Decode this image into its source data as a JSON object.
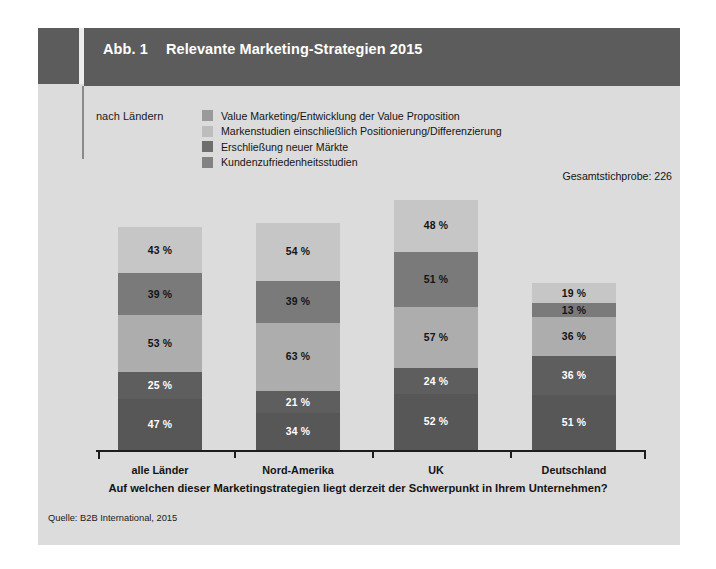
{
  "figure": {
    "number_label": "Abb. 1",
    "title": "Relevante Marketing-Strategien 2015",
    "subtitle": "nach Ländern",
    "sample_size": "Gesamtstichprobe: 226",
    "question": "Auf welchen dieser Marketingstrategien liegt derzeit der Schwerpunkt in Ihrem Unternehmen?",
    "source": "Quelle: B2B International, 2015"
  },
  "colors": {
    "page_background": "#ffffff",
    "panel_background": "#dcdcdc",
    "header_bar": "#5c5c5c",
    "header_text": "#ffffff",
    "axis": "#1d1d1d",
    "series": [
      "#c6c6c6",
      "#7a7a7a",
      "#adadad",
      "#5e5e5e",
      "#575757"
    ]
  },
  "legend": {
    "items": [
      {
        "label": "Value Marketing/Entwicklung der Value Proposition",
        "color": "#9a9a9a"
      },
      {
        "label": "Markenstudien einschließlich Positionierung/Differenzierung",
        "color": "#bdbdbd"
      },
      {
        "label": "Erschließung neuer Märkte",
        "color": "#6e6e6e"
      },
      {
        "label": "Kundenzufriedenheitsstudien",
        "color": "#828282"
      }
    ]
  },
  "chart_data": {
    "type": "bar",
    "subtype": "stacked-vertical",
    "title": "Relevante Marketing-Strategien 2015",
    "xlabel": "",
    "ylabel": "",
    "grid": false,
    "legend_position": "top",
    "value_suffix": " %",
    "categories": [
      "alle Länder",
      "Nord-Amerika",
      "UK",
      "Deutschland"
    ],
    "stack_order": "top-to-bottom",
    "series": [
      {
        "name": "Segment 1 (oben)",
        "color": "#c6c6c6",
        "values": [
          43,
          54,
          48,
          19
        ],
        "label_color": "#141414"
      },
      {
        "name": "Segment 2",
        "color": "#7a7a7a",
        "values": [
          39,
          39,
          51,
          13
        ],
        "label_color": "#141414"
      },
      {
        "name": "Segment 3",
        "color": "#adadad",
        "values": [
          53,
          63,
          57,
          36
        ],
        "label_color": "#141414"
      },
      {
        "name": "Segment 4",
        "color": "#5e5e5e",
        "values": [
          25,
          21,
          24,
          36
        ],
        "label_color": "#ffffff"
      },
      {
        "name": "Segment 5 (unten)",
        "color": "#575757",
        "values": [
          47,
          34,
          52,
          51
        ],
        "label_color": "#ffffff"
      }
    ],
    "totals": [
      207,
      211,
      232,
      155
    ],
    "bar_labels": [
      [
        "43 %",
        "39 %",
        "53 %",
        "25 %",
        "47 %"
      ],
      [
        "54 %",
        "39 %",
        "63 %",
        "21 %",
        "34 %"
      ],
      [
        "48 %",
        "51 %",
        "57 %",
        "24 %",
        "52 %"
      ],
      [
        "19 %",
        "13 %",
        "36 %",
        "36 %",
        "51 %"
      ]
    ]
  }
}
